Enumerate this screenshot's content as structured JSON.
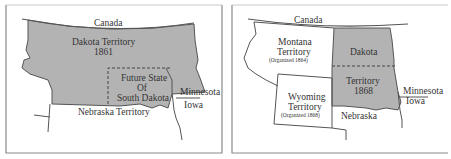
{
  "colors": {
    "territory_fill": "#b3b3b3",
    "background": "#ffffff",
    "border_line": "#555555",
    "frame": "#8a8a8a",
    "text": "#333333"
  },
  "panels": [
    {
      "id": "map-1861",
      "labels": {
        "canada": "Canada",
        "dakota_name": "Dakota Territory",
        "dakota_year": "1861",
        "future_line1": "Future State",
        "future_line2": "Of",
        "future_line3": "South Dakota",
        "minnesota": "Minnesota",
        "iowa": "Iowa",
        "nebraska": "Nebraska Territory"
      }
    },
    {
      "id": "map-1868",
      "labels": {
        "canada": "Canada",
        "montana_line1": "Montana",
        "montana_line2": "Territory",
        "montana_note": "(Organized 1864)",
        "dakota": "Dakota",
        "territory": "Territory",
        "year": "1868",
        "wyoming_line1": "Wyoming",
        "wyoming_line2": "Territory",
        "wyoming_note": "(Organized 1868)",
        "nebraska": "Nebraska",
        "minnesota": "Minnesota",
        "iowa": "Iowa"
      }
    }
  ]
}
